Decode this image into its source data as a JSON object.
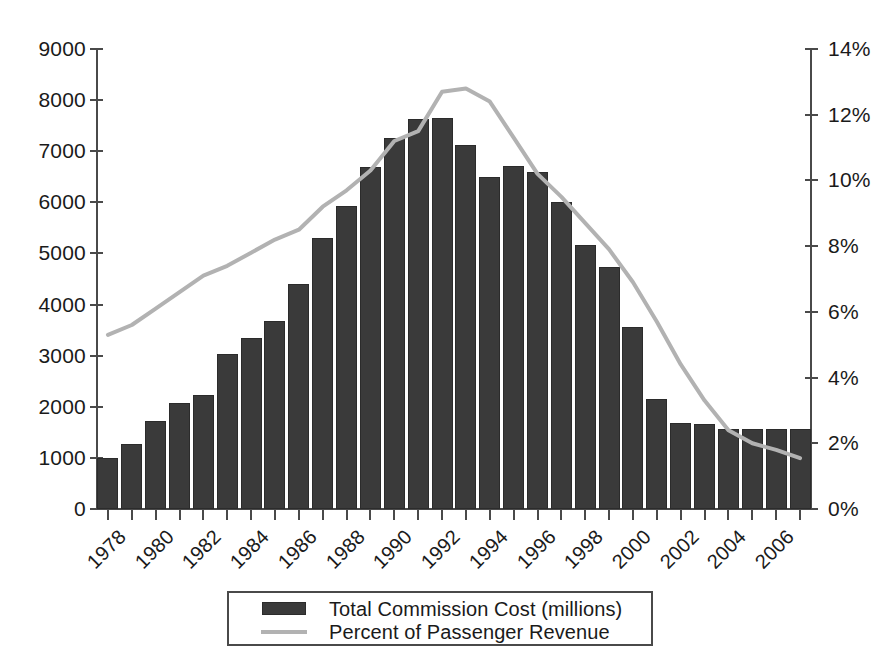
{
  "chart_data": {
    "type": "bar",
    "title": "",
    "subtitle": "",
    "xlabel": "",
    "ylabel": "",
    "grid": false,
    "legend_position": "bottom",
    "x": [
      1978,
      1979,
      1980,
      1981,
      1982,
      1983,
      1984,
      1985,
      1986,
      1987,
      1988,
      1989,
      1990,
      1991,
      1992,
      1993,
      1994,
      1995,
      1996,
      1997,
      1998,
      1999,
      2000,
      2001,
      2002,
      2003,
      2004,
      2005,
      2006,
      2007
    ],
    "categories": [
      "1978",
      "1979",
      "1980",
      "1981",
      "1982",
      "1983",
      "1984",
      "1985",
      "1986",
      "1987",
      "1988",
      "1989",
      "1990",
      "1991",
      "1992",
      "1993",
      "1994",
      "1995",
      "1996",
      "1997",
      "1998",
      "1999",
      "2000",
      "2001",
      "2002",
      "2003",
      "2004",
      "2005",
      "2006",
      "2007"
    ],
    "x_tick_labels": [
      "1978",
      "",
      "1980",
      "",
      "1982",
      "",
      "1984",
      "",
      "1986",
      "",
      "1988",
      "",
      "1990",
      "",
      "1992",
      "",
      "1994",
      "",
      "1996",
      "",
      "1998",
      "",
      "2000",
      "",
      "2002",
      "",
      "2004",
      "",
      "2006",
      ""
    ],
    "series": [
      {
        "name": "Total Commission Cost (millions)",
        "kind": "bar",
        "axis": "left",
        "color": "#3a3a3a",
        "values": [
          1000,
          1280,
          1720,
          2080,
          2230,
          3030,
          3350,
          3680,
          4400,
          5300,
          5930,
          6700,
          7250,
          7640,
          7660,
          7120,
          6500,
          6710,
          6600,
          6010,
          5170,
          4740,
          3570,
          2150,
          1680,
          1660,
          1560,
          1560,
          1560,
          1560
        ]
      },
      {
        "name": "Percent of Passenger Revenue",
        "kind": "line",
        "axis": "right",
        "color": "#b2b2b2",
        "values": [
          5.3,
          5.6,
          6.1,
          6.6,
          7.1,
          7.4,
          7.8,
          8.2,
          8.5,
          9.2,
          9.7,
          10.3,
          11.2,
          11.5,
          12.7,
          12.8,
          12.4,
          11.3,
          10.2,
          9.5,
          8.7,
          7.9,
          6.9,
          5.7,
          4.4,
          3.3,
          2.4,
          2.0,
          1.8,
          1.55
        ]
      }
    ],
    "axes": {
      "left": {
        "label": "",
        "min": 0,
        "max": 9000,
        "step": 1000,
        "ticks": [
          "0",
          "1000",
          "2000",
          "3000",
          "4000",
          "5000",
          "6000",
          "7000",
          "8000",
          "9000"
        ]
      },
      "right": {
        "label": "",
        "min": 0,
        "max": 14,
        "step": 2,
        "ticks": [
          "0%",
          "2%",
          "4%",
          "6%",
          "8%",
          "10%",
          "12%",
          "14%"
        ]
      }
    }
  },
  "legend": {
    "items": [
      {
        "label": "Total Commission Cost (millions)",
        "marker": "bar-swatch-icon",
        "color": "#3a3a3a"
      },
      {
        "label": "Percent of Passenger Revenue",
        "marker": "line-swatch-icon",
        "color": "#b2b2b2"
      }
    ]
  }
}
